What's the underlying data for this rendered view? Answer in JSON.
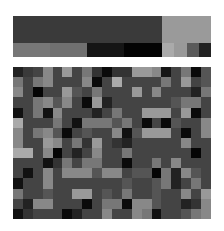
{
  "top_block": {
    "row_a": [
      {
        "width": 149,
        "color": "#3a3a3a"
      },
      {
        "width": 49,
        "color": "#9a9a9a"
      }
    ],
    "row_b": [
      {
        "width": 37,
        "color": "#777777"
      },
      {
        "width": 37,
        "color": "#707070"
      },
      {
        "width": 37,
        "color": "#151515"
      },
      {
        "width": 38,
        "color": "#030303"
      },
      {
        "width": 12,
        "color": "#aaaaaa"
      },
      {
        "width": 13,
        "color": "#999999"
      },
      {
        "width": 12,
        "color": "#5a5a5a"
      },
      {
        "width": 12,
        "color": "#222222"
      }
    ]
  },
  "grid": {
    "rows": 15,
    "cols": 20,
    "cells": [
      [
        "#222222",
        "#3a3a3a",
        "#444444",
        "#888888",
        "#444444",
        "#999999",
        "#444444",
        "#777777",
        "#333333",
        "#0a0a0a",
        "#333333",
        "#333333",
        "#999999",
        "#999999",
        "#888888",
        "#151515",
        "#444444",
        "#777777",
        "#0a0a0a",
        "#555555"
      ],
      [
        "#777777",
        "#444444",
        "#777777",
        "#888888",
        "#444444",
        "#444444",
        "#444444",
        "#888888",
        "#0a0a0a",
        "#444444",
        "#aaaaaa",
        "#444444",
        "#444444",
        "#444444",
        "#444444",
        "#777777",
        "#444444",
        "#999999",
        "#444444",
        "#555555"
      ],
      [
        "#888888",
        "#444444",
        "#050505",
        "#444444",
        "#444444",
        "#999999",
        "#555555",
        "#444444",
        "#777777",
        "#444444",
        "#444444",
        "#444444",
        "#999999",
        "#444444",
        "#888888",
        "#444444",
        "#444444",
        "#444444",
        "#222222",
        "#777777"
      ],
      [
        "#444444",
        "#444444",
        "#777777",
        "#888888",
        "#555555",
        "#888888",
        "#444444",
        "#0a0a0a",
        "#999999",
        "#222222",
        "#444444",
        "#444444",
        "#444444",
        "#444444",
        "#444444",
        "#444444",
        "#555555",
        "#777777",
        "#777777",
        "#444444"
      ],
      [
        "#111111",
        "#444444",
        "#777777",
        "#111111",
        "#888888",
        "#444444",
        "#444444",
        "#444444",
        "#222222",
        "#444444",
        "#777777",
        "#444444",
        "#444444",
        "#999999",
        "#999999",
        "#999999",
        "#444444",
        "#999999",
        "#0a0a0a",
        "#444444"
      ],
      [
        "#aaaaaa",
        "#444444",
        "#444444",
        "#444444",
        "#777777",
        "#444444",
        "#111111",
        "#777777",
        "#777777",
        "#777777",
        "#555555",
        "#777777",
        "#444444",
        "#0a0a0a",
        "#444444",
        "#0a0a0a",
        "#555555",
        "#444444",
        "#444444",
        "#888888"
      ],
      [
        "#888888",
        "#444444",
        "#777777",
        "#888888",
        "#555555",
        "#0a0a0a",
        "#444444",
        "#555555",
        "#444444",
        "#444444",
        "#888888",
        "#111111",
        "#555555",
        "#999999",
        "#999999",
        "#999999",
        "#444444",
        "#0a0a0a",
        "#444444",
        "#888888"
      ],
      [
        "#888888",
        "#444444",
        "#444444",
        "#999999",
        "#888888",
        "#444444",
        "#777777",
        "#333333",
        "#999999",
        "#444444",
        "#333333",
        "#222222",
        "#444444",
        "#444444",
        "#444444",
        "#444444",
        "#444444",
        "#888888",
        "#444444",
        "#444444"
      ],
      [
        "#aaaaaa",
        "#aaaaaa",
        "#444444",
        "#888888",
        "#050505",
        "#444444",
        "#222222",
        "#444444",
        "#888888",
        "#444444",
        "#444444",
        "#777777",
        "#444444",
        "#444444",
        "#444444",
        "#444444",
        "#444444",
        "#444444",
        "#050505",
        "#444444"
      ],
      [
        "#444444",
        "#444444",
        "#444444",
        "#111111",
        "#333333",
        "#777777",
        "#444444",
        "#777777",
        "#777777",
        "#444444",
        "#444444",
        "#0a0a0a",
        "#444444",
        "#444444",
        "#777777",
        "#444444",
        "#888888",
        "#444444",
        "#444444",
        "#444444"
      ],
      [
        "#444444",
        "#111111",
        "#444444",
        "#888888",
        "#444444",
        "#888888",
        "#888888",
        "#888888",
        "#555555",
        "#888888",
        "#888888",
        "#444444",
        "#555555",
        "#555555",
        "#050505",
        "#777777",
        "#222222",
        "#888888",
        "#555555",
        "#444444"
      ],
      [
        "#111111",
        "#444444",
        "#444444",
        "#888888",
        "#444444",
        "#444444",
        "#444444",
        "#444444",
        "#444444",
        "#444444",
        "#444444",
        "#555555",
        "#444444",
        "#444444",
        "#555555",
        "#777777",
        "#222222",
        "#444444",
        "#777777",
        "#444444"
      ],
      [
        "#777777",
        "#444444",
        "#444444",
        "#555555",
        "#444444",
        "#444444",
        "#999999",
        "#999999",
        "#444444",
        "#555555",
        "#444444",
        "#777777",
        "#444444",
        "#444444",
        "#555555",
        "#444444",
        "#444444",
        "#888888",
        "#444444",
        "#999999"
      ],
      [
        "#444444",
        "#222222",
        "#888888",
        "#888888",
        "#444444",
        "#444444",
        "#444444",
        "#0a0a0a",
        "#444444",
        "#777777",
        "#777777",
        "#0a0a0a",
        "#888888",
        "#888888",
        "#555555",
        "#444444",
        "#444444",
        "#222222",
        "#333333",
        "#888888"
      ],
      [
        "#111111",
        "#333333",
        "#444444",
        "#444444",
        "#444444",
        "#0a0a0a",
        "#222222",
        "#444444",
        "#444444",
        "#888888",
        "#444444",
        "#444444",
        "#888888",
        "#777777",
        "#111111",
        "#444444",
        "#444444",
        "#555555",
        "#777777",
        "#888888"
      ]
    ]
  }
}
